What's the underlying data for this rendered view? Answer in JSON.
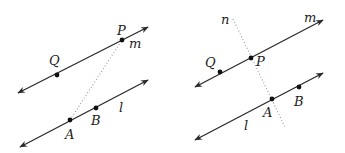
{
  "figures": [
    {
      "id": "left",
      "lines": [
        {
          "name": "m",
          "from": [
            18,
            93
          ],
          "to": [
            148,
            27
          ]
        },
        {
          "name": "l",
          "from": [
            20,
            147
          ],
          "to": [
            148,
            80
          ]
        }
      ],
      "segment": {
        "from": [
          70,
          120
        ],
        "to": [
          122,
          40
        ]
      },
      "points": [
        {
          "name": "P",
          "x": 122,
          "y": 40
        },
        {
          "name": "Q",
          "x": 57,
          "y": 75
        },
        {
          "name": "A",
          "x": 70,
          "y": 120
        },
        {
          "name": "B",
          "x": 96,
          "y": 108
        }
      ],
      "labels": [
        {
          "text": "P",
          "x": 117,
          "y": 35
        },
        {
          "text": "m",
          "x": 129,
          "y": 48
        },
        {
          "text": "Q",
          "x": 49,
          "y": 65
        },
        {
          "text": "A",
          "x": 65,
          "y": 139
        },
        {
          "text": "B",
          "x": 91,
          "y": 125
        },
        {
          "text": "l",
          "x": 119,
          "y": 112
        }
      ]
    },
    {
      "id": "right",
      "lines": [
        {
          "name": "m",
          "from": [
            195,
            87
          ],
          "to": [
            323,
            20
          ]
        },
        {
          "name": "l",
          "from": [
            195,
            140
          ],
          "to": [
            323,
            73
          ]
        }
      ],
      "segment": {
        "from": [
          233,
          19
        ],
        "to": [
          285,
          127
        ]
      },
      "points": [
        {
          "name": "P",
          "x": 251,
          "y": 58
        },
        {
          "name": "Q",
          "x": 220,
          "y": 72
        },
        {
          "name": "A",
          "x": 272,
          "y": 99
        },
        {
          "name": "B",
          "x": 299,
          "y": 87
        }
      ],
      "labels": [
        {
          "text": "n",
          "x": 221,
          "y": 24
        },
        {
          "text": "m",
          "x": 304,
          "y": 22
        },
        {
          "text": "P",
          "x": 256,
          "y": 66
        },
        {
          "text": "Q",
          "x": 205,
          "y": 67
        },
        {
          "text": "A",
          "x": 263,
          "y": 117
        },
        {
          "text": "B",
          "x": 294,
          "y": 106
        },
        {
          "text": "l",
          "x": 244,
          "y": 130
        }
      ]
    }
  ]
}
